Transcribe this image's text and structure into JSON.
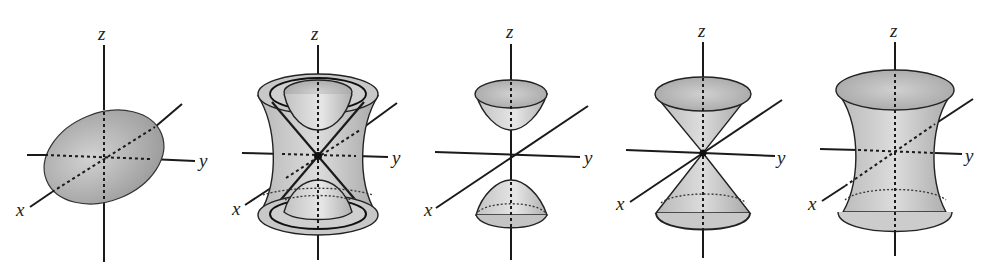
{
  "figure": {
    "panels": [
      {
        "name": "ellipsoid",
        "axis_labels": {
          "x": "x",
          "y": "y",
          "z": "z"
        }
      },
      {
        "name": "hyperboloids-and-cone-family",
        "axis_labels": {
          "x": "x",
          "y": "y",
          "z": "z"
        }
      },
      {
        "name": "hyperboloid-of-two-sheets",
        "axis_labels": {
          "x": "x",
          "y": "y",
          "z": "z"
        }
      },
      {
        "name": "elliptic-cone",
        "axis_labels": {
          "x": "x",
          "y": "y",
          "z": "z"
        }
      },
      {
        "name": "hyperboloid-of-one-sheet",
        "axis_labels": {
          "x": "x",
          "y": "y",
          "z": "z"
        }
      }
    ]
  },
  "colors": {
    "fill_light": "#d6d6d6",
    "fill_mid": "#bdbdbd",
    "fill_dark": "#9e9e9e",
    "line": "#1a1a1a",
    "background": "#ffffff"
  }
}
